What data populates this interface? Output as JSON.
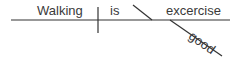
{
  "diagram": {
    "type": "sentence-diagram",
    "sentence": "Walking is good excercise",
    "words": {
      "subject": "Walking",
      "verb": "is",
      "complement": "excercise",
      "modifier": "good"
    },
    "colors": {
      "line": "#333333",
      "text": "#3a3a3a",
      "background": "#ffffff"
    }
  }
}
